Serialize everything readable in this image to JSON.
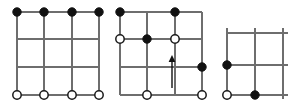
{
  "figure": {
    "title": "",
    "background_color": "#ffffff",
    "width": 300,
    "height": 107,
    "line_color": "#6e6e6e",
    "filled_node_color": "#111111",
    "open_node_color": "#ffffff",
    "open_node_border_color": "#1a1a1a",
    "node_radius": 4.2,
    "panel_count": 3
  },
  "panels": [
    {
      "id": "panel-left",
      "label": "",
      "origin": {
        "x": 17,
        "y": 12
      },
      "spacing": {
        "x": 27.3,
        "y": 27.7
      },
      "columns": 4,
      "rows": 4,
      "horizontal_lines": [
        {
          "row": 0,
          "x1": 17,
          "x2": 99,
          "y": 12
        },
        {
          "row": 1,
          "x1": 17,
          "x2": 99,
          "y": 39
        },
        {
          "row": 2,
          "x1": 17,
          "x2": 99,
          "y": 67
        },
        {
          "row": 3,
          "x1": 17,
          "x2": 99,
          "y": 95
        }
      ],
      "vertical_lines": [
        {
          "col": 0,
          "y1": 12,
          "y2": 95,
          "x": 17
        },
        {
          "col": 1,
          "y1": 12,
          "y2": 95,
          "x": 44
        },
        {
          "col": 2,
          "y1": 12,
          "y2": 95,
          "x": 72
        },
        {
          "col": 3,
          "y1": 12,
          "y2": 95,
          "x": 99
        }
      ],
      "nodes": [
        {
          "type": "filled",
          "x": 17,
          "y": 12
        },
        {
          "type": "filled",
          "x": 44,
          "y": 12
        },
        {
          "type": "filled",
          "x": 72,
          "y": 12
        },
        {
          "type": "filled",
          "x": 99,
          "y": 12
        },
        {
          "type": "open",
          "x": 17,
          "y": 95
        },
        {
          "type": "open",
          "x": 44,
          "y": 95
        },
        {
          "type": "open",
          "x": 72,
          "y": 95
        },
        {
          "type": "open",
          "x": 99,
          "y": 95
        }
      ],
      "arrows": []
    },
    {
      "id": "panel-middle",
      "label": "",
      "origin": {
        "x": 120,
        "y": 12
      },
      "spacing": {
        "x": 27.3,
        "y": 27.7
      },
      "columns": 4,
      "rows": 4,
      "horizontal_lines": [
        {
          "row": 0,
          "x1": 120,
          "x2": 202,
          "y": 12
        },
        {
          "row": 1,
          "x1": 120,
          "x2": 202,
          "y": 39
        },
        {
          "row": 2,
          "x1": 120,
          "x2": 202,
          "y": 67
        },
        {
          "row": 3,
          "x1": 120,
          "x2": 202,
          "y": 95
        }
      ],
      "vertical_lines": [
        {
          "col": 0,
          "y1": 12,
          "y2": 95,
          "x": 120
        },
        {
          "col": 1,
          "y1": 12,
          "y2": 95,
          "x": 147
        },
        {
          "col": 2,
          "y1": 12,
          "y2": 95,
          "x": 175
        },
        {
          "col": 3,
          "y1": 12,
          "y2": 95,
          "x": 202
        }
      ],
      "nodes": [
        {
          "type": "filled",
          "x": 120,
          "y": 12
        },
        {
          "type": "filled",
          "x": 175,
          "y": 12
        },
        {
          "type": "open",
          "x": 120,
          "y": 39
        },
        {
          "type": "filled",
          "x": 147,
          "y": 39
        },
        {
          "type": "open",
          "x": 175,
          "y": 39
        },
        {
          "type": "filled",
          "x": 202,
          "y": 67
        },
        {
          "type": "open",
          "x": 147,
          "y": 95
        },
        {
          "type": "open",
          "x": 202,
          "y": 95
        }
      ],
      "arrows": [
        {
          "direction": "up",
          "x": 172,
          "y_tail": 88,
          "y_head": 55
        }
      ]
    },
    {
      "id": "panel-right",
      "label": "",
      "origin": {
        "x": 227,
        "y": 33
      },
      "spacing": {
        "x": 28,
        "y": 31
      },
      "columns": 3,
      "rows": 3,
      "horizontal_lines": [
        {
          "row": 0,
          "x1": 227,
          "x2": 288,
          "y": 33
        },
        {
          "row": 1,
          "x1": 223,
          "x2": 288,
          "y": 65
        },
        {
          "row": 2,
          "x1": 223,
          "x2": 288,
          "y": 95
        }
      ],
      "vertical_lines": [
        {
          "col": 0,
          "y1": 28,
          "y2": 95,
          "x": 227
        },
        {
          "col": 1,
          "y1": 28,
          "y2": 99,
          "x": 255
        },
        {
          "col": 2,
          "y1": 28,
          "y2": 99,
          "x": 283
        }
      ],
      "nodes": [
        {
          "type": "filled",
          "x": 227,
          "y": 65
        },
        {
          "type": "open",
          "x": 227,
          "y": 95
        },
        {
          "type": "filled",
          "x": 255,
          "y": 95
        }
      ],
      "arrows": []
    }
  ]
}
